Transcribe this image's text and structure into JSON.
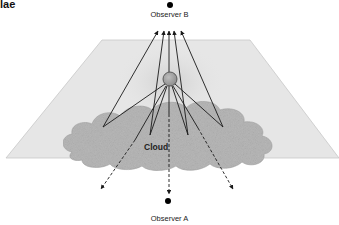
{
  "diagram": {
    "title_fragment": "lae",
    "observer_top": {
      "label": "Observer B"
    },
    "observer_bottom": {
      "label": "Observer A"
    },
    "cloud": {
      "label": "Cloud"
    },
    "colors": {
      "plane_fill": "#e6e6e6",
      "plane_stroke": "#c8c8c8",
      "cloud_fill": "#b9b9b9",
      "source_fill": "#9a9a9a",
      "line_color": "#1a1a1a",
      "dot_color": "#000000"
    },
    "rays": {
      "solid_to_observer_b": 5,
      "solid_to_cloud": 4,
      "dashed_through_cloud": 3
    }
  }
}
